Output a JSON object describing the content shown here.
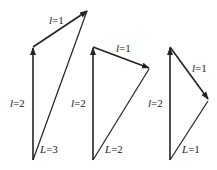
{
  "diagrams": [
    {
      "name": "L=3",
      "base": [
        33,
        160
      ],
      "mid": [
        33,
        47
      ],
      "tip": [
        88,
        10
      ],
      "labels": {
        "l2": {
          "var": "l",
          "eq": "=2",
          "x": 10,
          "y": 107
        },
        "l1": {
          "var": "l",
          "eq": "=1",
          "x": 49,
          "y": 24
        },
        "L": {
          "var": "L",
          "eq": "=3",
          "x": 40,
          "y": 153
        }
      }
    },
    {
      "name": "L=2",
      "base": [
        93,
        160
      ],
      "mid": [
        93,
        47
      ],
      "tip": [
        150,
        68
      ],
      "labels": {
        "l2": {
          "var": "l",
          "eq": "=2",
          "x": 71,
          "y": 107
        },
        "l1": {
          "var": "l",
          "eq": "=1",
          "x": 116,
          "y": 52
        },
        "L": {
          "var": "L",
          "eq": "=2",
          "x": 105,
          "y": 153
        }
      }
    },
    {
      "name": "L=1",
      "base": [
        170,
        160
      ],
      "mid": [
        170,
        47
      ],
      "tip": [
        209,
        100
      ],
      "labels": {
        "l2": {
          "var": "l",
          "eq": "=2",
          "x": 148,
          "y": 107
        },
        "l1": {
          "var": "l",
          "eq": "=1",
          "x": 192,
          "y": 72
        },
        "L": {
          "var": "L",
          "eq": "=1",
          "x": 182,
          "y": 153
        }
      }
    }
  ]
}
